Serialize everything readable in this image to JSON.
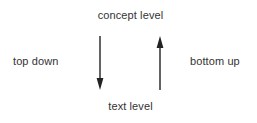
{
  "diagram": {
    "type": "two-way-level-arrows",
    "background_color": "#ffffff",
    "stroke_color": "#222222",
    "text_color": "#333333",
    "labels": {
      "top": "concept level",
      "bottom": "text level",
      "left": "top down",
      "right": "bottom up"
    },
    "arrows": [
      {
        "name": "top-down-arrow",
        "direction": "down",
        "from": "concept level",
        "to": "text level",
        "x": 100,
        "y_start": 36,
        "y_end": 90
      },
      {
        "name": "bottom-up-arrow",
        "direction": "up",
        "from": "text level",
        "to": "concept level",
        "x": 160,
        "y_start": 90,
        "y_end": 36
      }
    ]
  }
}
